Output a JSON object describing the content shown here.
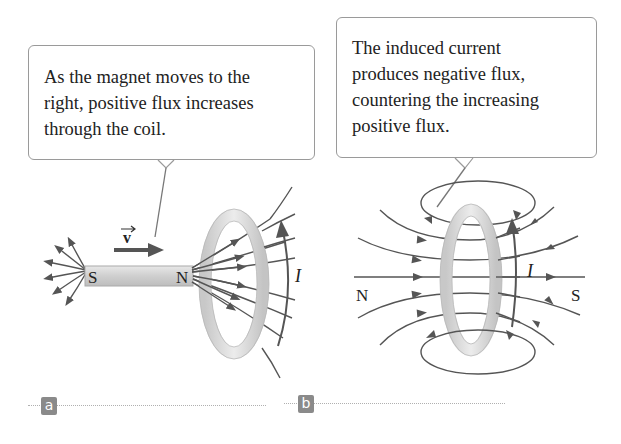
{
  "figure": {
    "panel_a": {
      "label": "a",
      "callout_lines": [
        "As the magnet moves to the",
        "right, positive flux increases",
        "through the coil."
      ],
      "magnet_south_label": "S",
      "magnet_north_label": "N",
      "velocity_label": "v",
      "current_label": "I"
    },
    "panel_b": {
      "label": "b",
      "callout_lines": [
        "The induced current",
        "produces negative flux,",
        "countering the increasing",
        "positive flux."
      ],
      "north_label": "N",
      "south_label": "S",
      "current_label": "I"
    },
    "colors": {
      "field_line": "#555555",
      "coil": "#d4d4d4",
      "magnet": "#d0d0d0",
      "badge": "#8a8a8a",
      "callout_border": "#9a9a9a"
    }
  }
}
